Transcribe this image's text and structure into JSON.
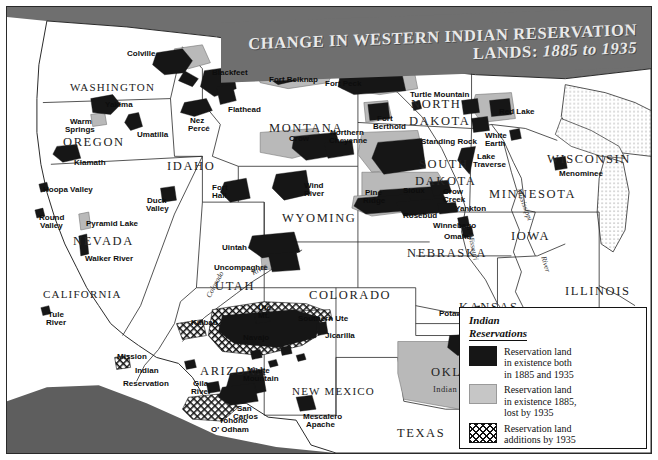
{
  "title": {
    "line1": "CHANGE IN WESTERN INDIAN RESERVATION",
    "line2_prefix": "LANDS: ",
    "line2_years": "1885 to 1935"
  },
  "legend": {
    "heading_line1": "Indian",
    "heading_line2": "Reservations",
    "entries": [
      {
        "swatch": "black",
        "line1": "Reservation land",
        "line2": "in existence both",
        "line3": "in 1885 and 1935"
      },
      {
        "swatch": "grey",
        "line1": "Reservation land",
        "line2": "in existence 1885,",
        "line3": "lost by 1935"
      },
      {
        "swatch": "hatch",
        "line1": "Reservation land",
        "line2": "additions by 1935",
        "line3": ""
      }
    ]
  },
  "states": [
    {
      "name": "WASHINGTON",
      "x": 63,
      "y": 74
    },
    {
      "name": "OREGON",
      "x": 56,
      "y": 128
    },
    {
      "name": "IDAHO",
      "x": 160,
      "y": 152
    },
    {
      "name": "MONTANA",
      "x": 262,
      "y": 114
    },
    {
      "name": "NORTH",
      "x": 404,
      "y": 90
    },
    {
      "name": "DAKOTA",
      "x": 402,
      "y": 107
    },
    {
      "name": "SOUTH",
      "x": 412,
      "y": 150
    },
    {
      "name": "DAKOTA",
      "x": 408,
      "y": 167
    },
    {
      "name": "MINNESOTA",
      "x": 482,
      "y": 180
    },
    {
      "name": "WISCONSIN",
      "x": 540,
      "y": 145
    },
    {
      "name": "WYOMING",
      "x": 275,
      "y": 204
    },
    {
      "name": "NEVADA",
      "x": 66,
      "y": 227
    },
    {
      "name": "CALIFORNIA",
      "x": 36,
      "y": 281
    },
    {
      "name": "UTAH",
      "x": 208,
      "y": 272
    },
    {
      "name": "COLORADO",
      "x": 302,
      "y": 281
    },
    {
      "name": "NEBRASKA",
      "x": 400,
      "y": 239
    },
    {
      "name": "IOWA",
      "x": 504,
      "y": 222
    },
    {
      "name": "ILLINOIS",
      "x": 558,
      "y": 277
    },
    {
      "name": "KANSAS",
      "x": 452,
      "y": 293
    },
    {
      "name": "ARIZONA",
      "x": 193,
      "y": 357
    },
    {
      "name": "NEW MEXICO",
      "x": 285,
      "y": 378
    },
    {
      "name": "OKLAHOMA",
      "x": 424,
      "y": 358
    },
    {
      "name": "TEXAS",
      "x": 390,
      "y": 419
    }
  ],
  "territory_labels": [
    {
      "name": "Indian Territory",
      "x": 426,
      "y": 377
    }
  ],
  "reservations": [
    {
      "name": "Colville",
      "x": 120,
      "y": 43,
      "align": "left"
    },
    {
      "name": "Yakima",
      "x": 98,
      "y": 94,
      "align": "left"
    },
    {
      "name": "Warm",
      "x": 63,
      "y": 111,
      "align": "left"
    },
    {
      "name": "Springs",
      "x": 58,
      "y": 119,
      "align": "left"
    },
    {
      "name": "Umatilla",
      "x": 130,
      "y": 124,
      "align": "left"
    },
    {
      "name": "Nez",
      "x": 183,
      "y": 110,
      "align": "left"
    },
    {
      "name": "Percé",
      "x": 181,
      "y": 118,
      "align": "left"
    },
    {
      "name": "Klamath",
      "x": 67,
      "y": 152,
      "align": "left"
    },
    {
      "name": "Blackfeet",
      "x": 205,
      "y": 62,
      "align": "left"
    },
    {
      "name": "Flathead",
      "x": 221,
      "y": 99,
      "align": "left"
    },
    {
      "name": "Fort Belknap",
      "x": 262,
      "y": 69,
      "align": "left"
    },
    {
      "name": "Fort Peck",
      "x": 318,
      "y": 73,
      "align": "left"
    },
    {
      "name": "Crow",
      "x": 282,
      "y": 128,
      "align": "left"
    },
    {
      "name": "Northern",
      "x": 323,
      "y": 122,
      "align": "left"
    },
    {
      "name": "Cheyenne",
      "x": 322,
      "y": 130,
      "align": "left"
    },
    {
      "name": "Fort",
      "x": 370,
      "y": 108,
      "align": "left"
    },
    {
      "name": "Berthold",
      "x": 366,
      "y": 116,
      "align": "left"
    },
    {
      "name": "Turtle Mountain",
      "x": 403,
      "y": 84,
      "align": "left"
    },
    {
      "name": "Standing Rock",
      "x": 414,
      "y": 131,
      "align": "left"
    },
    {
      "name": "Red Lake",
      "x": 492,
      "y": 101,
      "align": "left"
    },
    {
      "name": "White",
      "x": 478,
      "y": 125,
      "align": "left"
    },
    {
      "name": "Earth",
      "x": 478,
      "y": 133,
      "align": "left"
    },
    {
      "name": "Lake",
      "x": 470,
      "y": 146,
      "align": "left"
    },
    {
      "name": "Traverse",
      "x": 466,
      "y": 154,
      "align": "left"
    },
    {
      "name": "Menominee",
      "x": 552,
      "y": 163,
      "align": "left"
    },
    {
      "name": "Sioux",
      "x": 396,
      "y": 180,
      "align": "left"
    },
    {
      "name": "Pine",
      "x": 358,
      "y": 182,
      "align": "left"
    },
    {
      "name": "Ridge",
      "x": 356,
      "y": 190,
      "align": "left"
    },
    {
      "name": "Crow",
      "x": 436,
      "y": 181,
      "align": "left"
    },
    {
      "name": "Creek",
      "x": 436,
      "y": 189,
      "align": "left"
    },
    {
      "name": "Rosebud",
      "x": 396,
      "y": 205,
      "align": "left"
    },
    {
      "name": "Yankton",
      "x": 448,
      "y": 198,
      "align": "left"
    },
    {
      "name": "Winnebago",
      "x": 426,
      "y": 215,
      "align": "left"
    },
    {
      "name": "Omaha",
      "x": 437,
      "y": 226,
      "align": "left"
    },
    {
      "name": "Potawatomi",
      "x": 432,
      "y": 303,
      "align": "left"
    },
    {
      "name": "Osage",
      "x": 456,
      "y": 324,
      "align": "left"
    },
    {
      "name": "Hoopa Valley",
      "x": 36,
      "y": 179,
      "align": "left"
    },
    {
      "name": "Round",
      "x": 32,
      "y": 207,
      "align": "left"
    },
    {
      "name": "Valley",
      "x": 33,
      "y": 215,
      "align": "left"
    },
    {
      "name": "Duck",
      "x": 140,
      "y": 190,
      "align": "left"
    },
    {
      "name": "Valley",
      "x": 139,
      "y": 198,
      "align": "left"
    },
    {
      "name": "Pyramid Lake",
      "x": 79,
      "y": 213,
      "align": "left"
    },
    {
      "name": "Walker River",
      "x": 78,
      "y": 248,
      "align": "left"
    },
    {
      "name": "Fort",
      "x": 205,
      "y": 177,
      "align": "left"
    },
    {
      "name": "Hall",
      "x": 205,
      "y": 185,
      "align": "left"
    },
    {
      "name": "Wind",
      "x": 297,
      "y": 175,
      "align": "left"
    },
    {
      "name": "River",
      "x": 297,
      "y": 183,
      "align": "left"
    },
    {
      "name": "Uintah",
      "x": 215,
      "y": 237,
      "align": "left"
    },
    {
      "name": "Uncompaghre",
      "x": 207,
      "y": 257,
      "align": "left"
    },
    {
      "name": "Tule",
      "x": 41,
      "y": 304,
      "align": "left"
    },
    {
      "name": "River",
      "x": 39,
      "y": 312,
      "align": "left"
    },
    {
      "name": "Mission",
      "x": 110,
      "y": 346,
      "align": "left"
    },
    {
      "name": "Indian",
      "x": 128,
      "y": 360,
      "align": "left"
    },
    {
      "name": "Reservation",
      "x": 116,
      "y": 373,
      "align": "left"
    },
    {
      "name": "Kaibab",
      "x": 184,
      "y": 312,
      "align": "left"
    },
    {
      "name": "Ute",
      "x": 251,
      "y": 297,
      "align": "left"
    },
    {
      "name": "Mt.",
      "x": 251,
      "y": 305,
      "align": "left"
    },
    {
      "name": "Southern Ute",
      "x": 291,
      "y": 308,
      "align": "left"
    },
    {
      "name": "Jicarilla",
      "x": 318,
      "y": 325,
      "align": "left"
    },
    {
      "name": "Navajo",
      "x": 236,
      "y": 327,
      "align": "left"
    },
    {
      "name": "Gila",
      "x": 186,
      "y": 373,
      "align": "left"
    },
    {
      "name": "River",
      "x": 184,
      "y": 381,
      "align": "left"
    },
    {
      "name": "White",
      "x": 241,
      "y": 360,
      "align": "left"
    },
    {
      "name": "Mountain",
      "x": 236,
      "y": 368,
      "align": "left"
    },
    {
      "name": "San",
      "x": 230,
      "y": 398,
      "align": "left"
    },
    {
      "name": "Carlos",
      "x": 226,
      "y": 406,
      "align": "left"
    },
    {
      "name": "Tohono",
      "x": 212,
      "y": 410,
      "align": "left"
    },
    {
      "name": "O' Odham",
      "x": 204,
      "y": 419,
      "align": "left"
    },
    {
      "name": "Mescalero",
      "x": 296,
      "y": 406,
      "align": "left"
    },
    {
      "name": "Apache",
      "x": 299,
      "y": 414,
      "align": "left"
    }
  ],
  "rivers": [
    {
      "name": "Colorado",
      "x": 197,
      "y": 288,
      "rot": -62
    },
    {
      "name": "River",
      "x": 243,
      "y": 262,
      "rot": -28
    },
    {
      "name": "Mississippi",
      "x": 516,
      "y": 180,
      "rot": 70
    },
    {
      "name": "Missouri",
      "x": 468,
      "y": 226,
      "rot": 78
    },
    {
      "name": "River",
      "x": 489,
      "y": 303,
      "rot": -12
    },
    {
      "name": "River",
      "x": 541,
      "y": 248,
      "rot": 74
    }
  ],
  "colors": {
    "existing_both": "#161616",
    "lost_by_1935": "#b9b9b9",
    "additions_by_1935": "#ffffff",
    "canada": "#6f6f6f",
    "ocean": "#ffffff",
    "banner": "#6f6f6f",
    "banner_text": "#e9e9e9"
  }
}
